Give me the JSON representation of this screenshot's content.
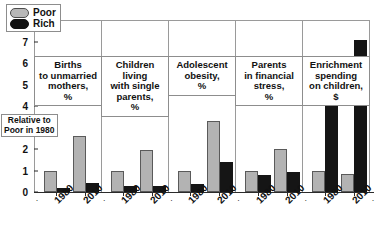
{
  "chart_data": {
    "type": "bar",
    "title": "",
    "subtitle": "",
    "xlabel": "",
    "ylabel": "Relative to\nPoor in 1980",
    "ylim": [
      0,
      8
    ],
    "yticks": [
      0,
      1,
      2,
      3,
      4,
      5,
      6,
      7,
      8
    ],
    "ytick_labels": [
      "0",
      "1",
      "2",
      "3",
      "4",
      "5",
      "6",
      "7",
      "8"
    ],
    "grid": false,
    "legend_position": "top-left-inside-panel-1",
    "legend": [
      {
        "name": "Poor",
        "color": "#b3b3b3"
      },
      {
        "name": "Rich",
        "color": "#151515"
      }
    ],
    "categories": [
      "1980",
      "2010"
    ],
    "panels": [
      {
        "title": "Births\nto unmarried\nmothers,\n%",
        "series": [
          {
            "name": "Poor",
            "values": [
              1.0,
              2.6
            ]
          },
          {
            "name": "Rich",
            "values": [
              0.2,
              0.4
            ]
          }
        ]
      },
      {
        "title": "Children\nliving\nwith single\nparents,\n%",
        "series": [
          {
            "name": "Poor",
            "values": [
              1.0,
              1.95
            ]
          },
          {
            "name": "Rich",
            "values": [
              0.3,
              0.27
            ]
          }
        ]
      },
      {
        "title": "Adolescent\nobesity,\n%",
        "series": [
          {
            "name": "Poor",
            "values": [
              1.0,
              3.3
            ]
          },
          {
            "name": "Rich",
            "values": [
              0.35,
              1.4
            ]
          }
        ]
      },
      {
        "title": "Parents\nin financial\nstress,\n%",
        "series": [
          {
            "name": "Poor",
            "values": [
              1.0,
              2.0
            ]
          },
          {
            "name": "Rich",
            "values": [
              0.8,
              0.93
            ]
          }
        ]
      },
      {
        "title": "Enrichment\nspending\non children,\n$",
        "series": [
          {
            "name": "Poor",
            "values": [
              1.0,
              0.85
            ]
          },
          {
            "name": "Rich",
            "values": [
              4.7,
              7.05
            ]
          }
        ]
      }
    ]
  },
  "colors": {
    "poor": "#b3b3b3",
    "rich": "#151515",
    "axis": "#2b2b2b",
    "panel_border": "#9a9a9a",
    "background": "#ffffff"
  }
}
